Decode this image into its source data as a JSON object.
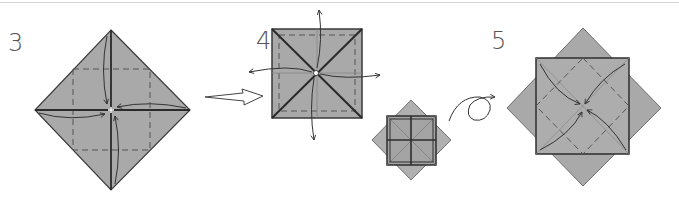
{
  "diagram": {
    "colors": {
      "paper": "#a9a9a9",
      "paper_light": "#b3b3b3",
      "outline": "#3a3a3a",
      "crease_dash": "#555555",
      "arrow": "#333333",
      "background": "#ffffff",
      "rule": "#d4d4d4"
    },
    "steps": [
      {
        "number": "3",
        "shape": "diamond",
        "action": "fold four corners to center (blintz)",
        "arrows": 4
      },
      {
        "number": "4",
        "shape": "square",
        "action": "unfold four corner flaps outward",
        "arrows": 4
      },
      {
        "number": "",
        "shape": "square-over-diamond (small)",
        "action": "result, then turn over",
        "arrows": 0
      },
      {
        "number": "5",
        "shape": "square-over-diamond",
        "action": "fold four corners to center",
        "arrows": 4
      }
    ],
    "transitions": [
      {
        "from": "3",
        "to": "4",
        "icon": "hollow-right-arrow-icon"
      },
      {
        "from": "small",
        "to": "5",
        "icon": "turn-over-arrow-icon"
      }
    ]
  }
}
